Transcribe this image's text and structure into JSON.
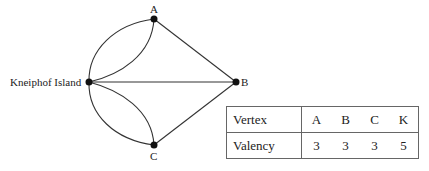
{
  "graph": {
    "nodes": [
      {
        "id": "A",
        "label": "A"
      },
      {
        "id": "B",
        "label": "B"
      },
      {
        "id": "C",
        "label": "C"
      },
      {
        "id": "K",
        "label": "Kneiphof Island"
      }
    ],
    "edges": [
      [
        "K",
        "A"
      ],
      [
        "K",
        "A"
      ],
      [
        "K",
        "C"
      ],
      [
        "K",
        "C"
      ],
      [
        "K",
        "B"
      ],
      [
        "A",
        "B"
      ],
      [
        "C",
        "B"
      ]
    ]
  },
  "table": {
    "header_label": "Vertex",
    "row_label": "Valency",
    "vertices": [
      "A",
      "B",
      "C",
      "K"
    ],
    "valencies": [
      "3",
      "3",
      "3",
      "5"
    ]
  }
}
